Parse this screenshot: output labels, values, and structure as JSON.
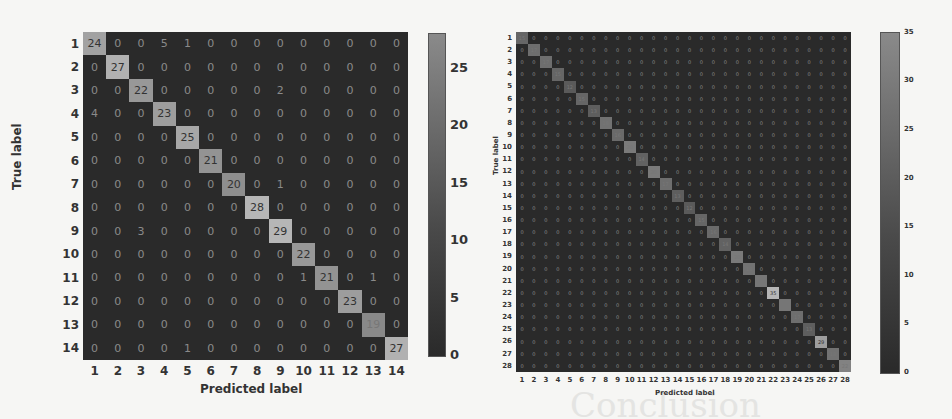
{
  "chart_data": [
    {
      "type": "heatmap",
      "title": "",
      "xlabel": "Predicted label",
      "ylabel": "True label",
      "labels": [
        "1",
        "2",
        "3",
        "4",
        "5",
        "6",
        "7",
        "8",
        "9",
        "10",
        "11",
        "12",
        "13",
        "14"
      ],
      "matrix": [
        [
          24,
          0,
          0,
          5,
          1,
          0,
          0,
          0,
          0,
          0,
          0,
          0,
          0,
          0
        ],
        [
          0,
          27,
          0,
          0,
          0,
          0,
          0,
          0,
          0,
          0,
          0,
          0,
          0,
          0
        ],
        [
          0,
          0,
          22,
          0,
          0,
          0,
          0,
          0,
          2,
          0,
          0,
          0,
          0,
          0
        ],
        [
          4,
          0,
          0,
          23,
          0,
          0,
          0,
          0,
          0,
          0,
          0,
          0,
          0,
          0
        ],
        [
          0,
          0,
          0,
          0,
          25,
          0,
          0,
          0,
          0,
          0,
          0,
          0,
          0,
          0
        ],
        [
          0,
          0,
          0,
          0,
          0,
          21,
          0,
          0,
          0,
          0,
          0,
          0,
          0,
          0
        ],
        [
          0,
          0,
          0,
          0,
          0,
          0,
          20,
          0,
          1,
          0,
          0,
          0,
          0,
          0
        ],
        [
          0,
          0,
          0,
          0,
          0,
          0,
          0,
          28,
          0,
          0,
          0,
          0,
          0,
          0
        ],
        [
          0,
          0,
          3,
          0,
          0,
          0,
          0,
          0,
          29,
          0,
          0,
          0,
          0,
          0
        ],
        [
          0,
          0,
          0,
          0,
          0,
          0,
          0,
          0,
          0,
          22,
          0,
          0,
          0,
          0
        ],
        [
          0,
          0,
          0,
          0,
          0,
          0,
          0,
          0,
          0,
          1,
          21,
          0,
          1,
          0
        ],
        [
          0,
          0,
          0,
          0,
          0,
          0,
          0,
          0,
          0,
          0,
          0,
          23,
          0,
          0
        ],
        [
          0,
          0,
          0,
          0,
          0,
          0,
          0,
          0,
          0,
          0,
          0,
          0,
          19,
          0
        ],
        [
          0,
          0,
          0,
          0,
          1,
          0,
          0,
          0,
          0,
          0,
          0,
          0,
          0,
          27
        ]
      ],
      "colorbar": {
        "ticks": [
          0,
          5,
          10,
          15,
          20,
          25
        ],
        "range": [
          0,
          28
        ]
      }
    },
    {
      "type": "heatmap",
      "title": "",
      "xlabel": "Predicted label",
      "ylabel": "True label",
      "labels": [
        "1",
        "2",
        "3",
        "4",
        "5",
        "6",
        "7",
        "8",
        "9",
        "10",
        "11",
        "12",
        "13",
        "14",
        "15",
        "16",
        "17",
        "18",
        "19",
        "20",
        "21",
        "22",
        "23",
        "24",
        "25",
        "26",
        "27",
        "28"
      ],
      "diagonal": [
        15,
        17,
        17,
        15,
        12,
        15,
        13,
        18,
        16,
        20,
        14,
        20,
        17,
        13,
        12,
        15,
        16,
        14,
        20,
        18,
        19,
        35,
        19,
        17,
        13,
        29,
        18,
        22
      ],
      "colorbar": {
        "ticks": [
          0,
          5,
          10,
          15,
          20,
          25,
          30,
          35
        ],
        "range": [
          0,
          35
        ]
      }
    }
  ],
  "background_text": "Conclusion"
}
